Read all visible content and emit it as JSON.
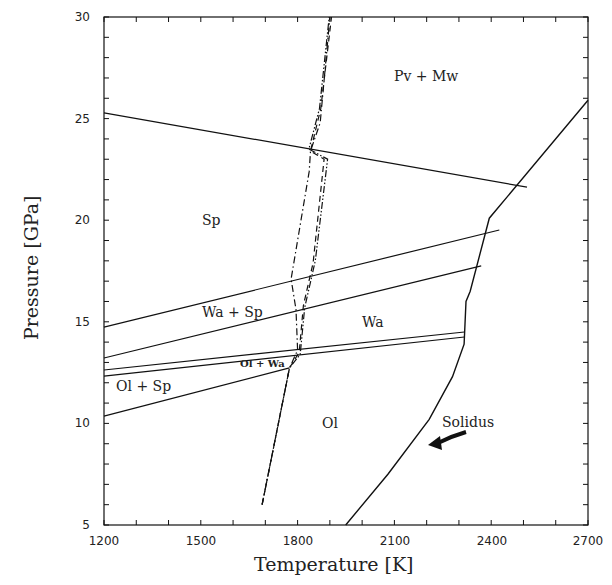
{
  "chart_data": {
    "type": "line",
    "title": "",
    "xlabel": "Temperature [K]",
    "ylabel": "Pressure [GPa]",
    "xlim": [
      1200,
      2700
    ],
    "ylim": [
      5,
      30
    ],
    "grid": false,
    "x_ticks": [
      1200,
      1500,
      1800,
      2100,
      2400,
      2700
    ],
    "y_ticks": [
      5,
      10,
      15,
      20,
      25,
      30
    ],
    "x_minor_step": 100,
    "y_minor_step": 1,
    "phase_boundaries": [
      {
        "name": "Sp / Pv+Mw",
        "points": [
          [
            1200,
            25.28
          ],
          [
            2511,
            21.63
          ]
        ]
      },
      {
        "name": "Wa+Sp / Sp",
        "points": [
          [
            1200,
            14.74
          ],
          [
            2425,
            19.52
          ]
        ]
      },
      {
        "name": "Wa / Wa+Sp",
        "points": [
          [
            1200,
            13.22
          ],
          [
            2369,
            17.75
          ]
        ]
      },
      {
        "name": "Ol+Wa upper",
        "points": [
          [
            1200,
            12.63
          ],
          [
            2317,
            14.5
          ]
        ]
      },
      {
        "name": "Ol+Wa lower",
        "points": [
          [
            1200,
            12.33
          ],
          [
            2317,
            14.25
          ]
        ]
      },
      {
        "name": "Ol+Sp lower",
        "points": [
          [
            1200,
            10.36
          ],
          [
            1775,
            12.73
          ]
        ]
      }
    ],
    "solidus": {
      "name": "Solidus",
      "points": [
        [
          1949,
          5
        ],
        [
          2080,
          7.5
        ],
        [
          2208,
          10.2
        ],
        [
          2280,
          12.3
        ],
        [
          2316,
          13.9
        ],
        [
          2322,
          16.0
        ],
        [
          2335,
          16.5
        ],
        [
          2394,
          20.1
        ],
        [
          2700,
          25.9
        ]
      ]
    },
    "adiabats": [
      {
        "name": "adiabat-dashdot",
        "style": "dash-dot",
        "points": [
          [
            1690,
            6
          ],
          [
            1775,
            12.73
          ],
          [
            1800,
            13.6
          ],
          [
            1795,
            15.6
          ],
          [
            1780,
            17.1
          ],
          [
            1836,
            22.4
          ],
          [
            1840,
            23.4
          ],
          [
            1870,
            24.8
          ],
          [
            1900,
            30
          ]
        ]
      },
      {
        "name": "adiabat-dash",
        "style": "dash",
        "points": [
          [
            1690,
            6
          ],
          [
            1775,
            12.73
          ],
          [
            1805,
            13.5
          ],
          [
            1818,
            15.8
          ],
          [
            1848,
            17.9
          ],
          [
            1882,
            23.0
          ],
          [
            1840,
            23.4
          ],
          [
            1872,
            25.5
          ],
          [
            1905,
            30
          ]
        ]
      },
      {
        "name": "adiabat-dashdotdot",
        "style": "dash-dot-dot",
        "points": [
          [
            1690,
            6
          ],
          [
            1775,
            12.73
          ],
          [
            1808,
            13.4
          ],
          [
            1822,
            15.7
          ],
          [
            1855,
            18.0
          ],
          [
            1893,
            23.0
          ],
          [
            1835,
            23.5
          ],
          [
            1868,
            25.5
          ],
          [
            1898,
            30
          ]
        ]
      }
    ],
    "region_labels": [
      {
        "text": "Pv + Mw",
        "x": 2230,
        "y": 27.6
      },
      {
        "text": "Sp",
        "x": 1530,
        "y": 20.8
      },
      {
        "text": "Wa + Sp",
        "x": 1560,
        "y": 15.6
      },
      {
        "text": "Wa",
        "x": 1990,
        "y": 14.7
      },
      {
        "text": "Ol + Wa",
        "x": 1660,
        "y": 12.9
      },
      {
        "text": "Ol + Sp",
        "x": 1300,
        "y": 11.6
      },
      {
        "text": "Ol",
        "x": 1960,
        "y": 10.8
      },
      {
        "text": "Solidus",
        "x": 2350,
        "y": 11.2
      }
    ],
    "annotation": {
      "text": "Solidus",
      "arrow_to": [
        2280,
        9.7
      ]
    }
  },
  "labels": {
    "xlabel": "Temperature [K]",
    "ylabel": "Pressure [GPa]",
    "x_ticks": [
      "1200",
      "1500",
      "1800",
      "2100",
      "2400",
      "2700"
    ],
    "y_ticks": [
      "5",
      "10",
      "15",
      "20",
      "25",
      "30"
    ],
    "regions": {
      "pv_mw": "Pv + Mw",
      "sp": "Sp",
      "wa_sp": "Wa + Sp",
      "wa": "Wa",
      "ol_wa": "Ol + Wa",
      "ol_sp": "Ol + Sp",
      "ol": "Ol",
      "solidus": "Solidus"
    }
  }
}
